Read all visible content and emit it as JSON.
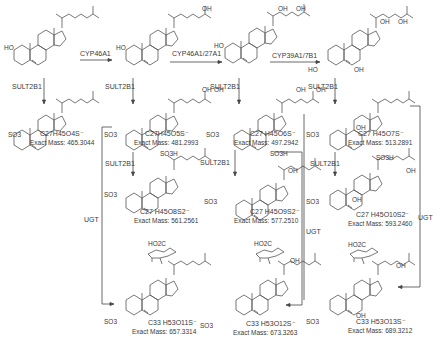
{
  "diagram": {
    "enzymes": {
      "cyp46a1": "CYP46A1",
      "cyp46a1_27a1": "CYP46A1/27A1",
      "cyp39a1_7b1": "CYP39A1/7B1",
      "sult2b1": "SULT2B1",
      "ugt": "UGT"
    },
    "groups": {
      "ho": "HO",
      "oh": "OH",
      "h": "H",
      "so3": "SO3",
      "so3h": "SO3H",
      "ho2c": "HO2C",
      "o": "O"
    },
    "row1": [
      {
        "id": "cholesterol",
        "label": ""
      },
      {
        "id": "24-hydroxycholesterol",
        "label": ""
      },
      {
        "id": "24,25-dihydroxycholesterol",
        "label": ""
      },
      {
        "id": "7,24,25-trihydroxycholesterol",
        "label": ""
      }
    ],
    "row2": [
      {
        "formula": "C27H45O4S⁻",
        "formula_html": [
          "C",
          27,
          "H",
          45,
          "O",
          4,
          "S⁻"
        ],
        "mass": "Exact Mass: 465.3044"
      },
      {
        "formula": "C27H45O5S⁻",
        "mass": "Exact Mass: 481.2993"
      },
      {
        "formula": "C27 H45O6S⁻",
        "mass": "Exact Mass: 497.2942"
      },
      {
        "formula": "C27 H45O7S⁻",
        "mass": "Exact Mass: 513.2891"
      }
    ],
    "row3": [
      {
        "formula": "C27 H45O8S2⁻",
        "mass": "Exact Mass: 561.2561"
      },
      {
        "formula": "C27 H45O9S2⁻",
        "mass": "Exact Mass: 577.2510"
      },
      {
        "formula": "C27 H45O10S2⁻",
        "mass": "Exact Mass: 593.2460"
      }
    ],
    "row4": [
      {
        "formula": "C33 H53O11S⁻",
        "mass": "Exact Mass: 657.3314"
      },
      {
        "formula": "C33 H53O12S⁻",
        "mass": "Exact Mass: 673.3263"
      },
      {
        "formula": "C33 H53O13S⁻",
        "mass": "Exact Mass: 689.3212"
      }
    ]
  }
}
